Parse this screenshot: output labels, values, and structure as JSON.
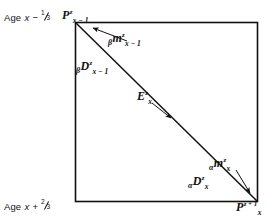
{
  "figure": {
    "type": "lexis-diagram",
    "background": "#ffffff",
    "stroke_color": "#111111",
    "box": {
      "x": 75,
      "y": 22,
      "width": 183,
      "height": 180
    },
    "diagonal": {
      "x1": 75,
      "y1": 22,
      "x2": 258,
      "y2": 202
    }
  },
  "axis_labels": {
    "top": {
      "prefix": "Age",
      "variable": "x",
      "operator": "−",
      "fraction_numerator": "1",
      "fraction_denominator": "3",
      "full_text": "Age x − 1/3"
    },
    "bottom": {
      "prefix": "Age",
      "variable": "x",
      "operator": "+",
      "fraction_numerator": "2",
      "fraction_denominator": "3",
      "full_text": "Age x + 2/3"
    }
  },
  "corner_labels": {
    "top_left": {
      "base": "P",
      "superscript": "z",
      "subscript": "x − 1",
      "full_text": "P^z_{x-1}"
    },
    "bottom_right": {
      "base": "P",
      "superscript": "z + 1",
      "subscript": "x",
      "full_text": "P^{z+1}_x"
    }
  },
  "annotations": {
    "beta_m": {
      "coefficient": "β",
      "base": "m",
      "superscript": "z",
      "subscript": "x − 1",
      "full_text": "βm^z_{x-1}",
      "has_arrow": true,
      "arrow_points_to": "top-left-corner"
    },
    "beta_D": {
      "coefficient": "β",
      "base": "D",
      "superscript": "z",
      "subscript": "x − 1",
      "full_text": "βD^z_{x-1}",
      "has_arrow": false
    },
    "E_center": {
      "coefficient": "",
      "base": "E",
      "superscript": "z",
      "subscript": "x",
      "full_text": "E^z_x",
      "has_arrow": true,
      "arrow_points_to": "diagonal-midpoint"
    },
    "alpha_m": {
      "coefficient": "α",
      "base": "m",
      "superscript": "z",
      "subscript": "x",
      "full_text": "αm^z_x",
      "has_arrow": true,
      "arrow_points_to": "bottom-right-corner"
    },
    "alpha_D": {
      "coefficient": "α",
      "base": "D",
      "superscript": "z",
      "subscript": "x",
      "full_text": "αD^z_x",
      "has_arrow": false
    }
  }
}
